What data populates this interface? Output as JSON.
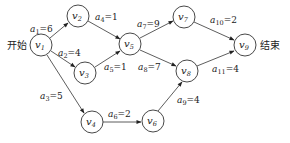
{
  "diagram": {
    "type": "activity-on-edge network (AOE)",
    "start_label": "开始",
    "end_label": "结束",
    "nodes": [
      {
        "id": "v1",
        "var": "v",
        "sub": "1",
        "x": 41,
        "y": 45
      },
      {
        "id": "v2",
        "var": "v",
        "sub": "2",
        "x": 78,
        "y": 16
      },
      {
        "id": "v3",
        "var": "v",
        "sub": "3",
        "x": 85,
        "y": 73
      },
      {
        "id": "v4",
        "var": "v",
        "sub": "4",
        "x": 92,
        "y": 122
      },
      {
        "id": "v5",
        "var": "v",
        "sub": "5",
        "x": 130,
        "y": 44
      },
      {
        "id": "v6",
        "var": "v",
        "sub": "6",
        "x": 153,
        "y": 121
      },
      {
        "id": "v7",
        "var": "v",
        "sub": "7",
        "x": 184,
        "y": 17
      },
      {
        "id": "v8",
        "var": "v",
        "sub": "8",
        "x": 187,
        "y": 71
      },
      {
        "id": "v9",
        "var": "v",
        "sub": "9",
        "x": 245,
        "y": 45
      }
    ],
    "edges": [
      {
        "id": "a1",
        "from": "v1",
        "to": "v2",
        "var": "a",
        "sub": "1",
        "weight": "6",
        "text": "a1=6"
      },
      {
        "id": "a2",
        "from": "v1",
        "to": "v3",
        "var": "a",
        "sub": "2",
        "weight": "4",
        "text": "a2=4"
      },
      {
        "id": "a3",
        "from": "v1",
        "to": "v4",
        "var": "a",
        "sub": "3",
        "weight": "5",
        "text": "a3=5"
      },
      {
        "id": "a4",
        "from": "v2",
        "to": "v5",
        "var": "a",
        "sub": "4",
        "weight": "1",
        "text": "a4=1"
      },
      {
        "id": "a5",
        "from": "v3",
        "to": "v5",
        "var": "a",
        "sub": "5",
        "weight": "1",
        "text": "a5=1"
      },
      {
        "id": "a6",
        "from": "v4",
        "to": "v6",
        "var": "a",
        "sub": "6",
        "weight": "2",
        "text": "a6=2"
      },
      {
        "id": "a7",
        "from": "v5",
        "to": "v7",
        "var": "a",
        "sub": "7",
        "weight": "9",
        "text": "a7=9"
      },
      {
        "id": "a8",
        "from": "v5",
        "to": "v8",
        "var": "a",
        "sub": "8",
        "weight": "7",
        "text": "a8=7"
      },
      {
        "id": "a9",
        "from": "v6",
        "to": "v8",
        "var": "a",
        "sub": "9",
        "weight": "4",
        "text": "a9=4"
      },
      {
        "id": "a10",
        "from": "v7",
        "to": "v9",
        "var": "a",
        "sub": "10",
        "weight": "2",
        "text": "a10=2"
      },
      {
        "id": "a11",
        "from": "v8",
        "to": "v9",
        "var": "a",
        "sub": "11",
        "weight": "4",
        "text": "a11=4"
      }
    ]
  }
}
